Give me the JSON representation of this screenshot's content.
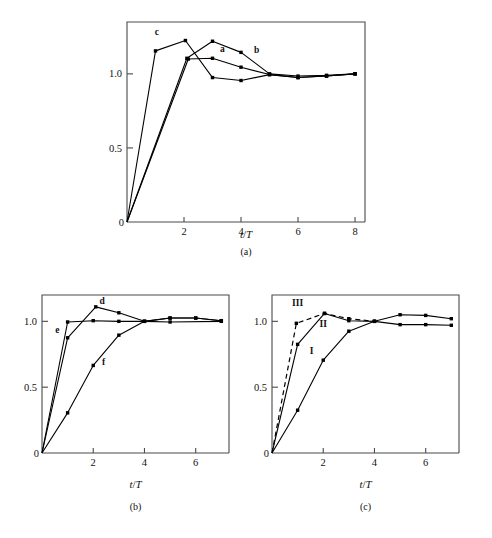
{
  "figure": {
    "background": "#ffffff",
    "ink": "#000000",
    "axis_color": "#4a4a4a"
  },
  "panels": [
    {
      "id": "a",
      "caption": "(a)",
      "xlabel_italic": "t",
      "xlabel_slash": "/",
      "xlabel_italic2": "T"
    },
    {
      "id": "b",
      "caption": "(b)",
      "xlabel_italic": "t",
      "xlabel_slash": "/",
      "xlabel_italic2": "T"
    },
    {
      "id": "c",
      "caption": "(c)",
      "xlabel_italic": "t",
      "xlabel_slash": "/",
      "xlabel_italic2": "T"
    }
  ],
  "chart_data": [
    {
      "type": "line",
      "panel": "a",
      "title": "",
      "xlabel": "t/T",
      "ylabel": "",
      "xlim": [
        0,
        8.35
      ],
      "ylim": [
        0,
        1.35
      ],
      "xticks": [
        0,
        2,
        4,
        6,
        8
      ],
      "xticklabels": [
        "0",
        "2",
        "4",
        "6",
        "8"
      ],
      "yticks": [
        0,
        0.5,
        1.0
      ],
      "yticklabels": [
        "0",
        "0.5",
        "1.0"
      ],
      "grid": false,
      "legend": "inline-curve-labels",
      "markers": "filled-square",
      "series": [
        {
          "name": "a",
          "style": "solid",
          "label_x": 3.35,
          "label_y": 1.145,
          "x": [
            0,
            2.1,
            3.0,
            4.0,
            5.0,
            6.0,
            7.0,
            8.0
          ],
          "y": [
            0,
            1.105,
            1.22,
            1.145,
            1.0,
            0.985,
            0.99,
            1.0
          ]
        },
        {
          "name": "b",
          "style": "solid",
          "label_x": 4.55,
          "label_y": 1.14,
          "x": [
            0,
            2.15,
            3.0,
            4.0,
            5.0,
            6.0,
            7.0,
            8.0
          ],
          "y": [
            0,
            1.1,
            1.105,
            1.045,
            0.995,
            0.975,
            0.985,
            1.0
          ]
        },
        {
          "name": "c",
          "style": "solid",
          "label_x": 1.05,
          "label_y": 1.265,
          "x": [
            0,
            1.0,
            2.05,
            3.0,
            4.0,
            5.0,
            6.0,
            7.0,
            8.0
          ],
          "y": [
            0,
            1.155,
            1.225,
            0.975,
            0.955,
            0.995,
            0.975,
            0.985,
            1.0
          ]
        }
      ]
    },
    {
      "type": "line",
      "panel": "b",
      "title": "",
      "xlabel": "t/T",
      "ylabel": "",
      "xlim": [
        0,
        7.3
      ],
      "ylim": [
        0,
        1.2
      ],
      "xticks": [
        0,
        2,
        4,
        6
      ],
      "xticklabels": [
        "0",
        "2",
        "4",
        "6"
      ],
      "yticks": [
        0,
        0.5,
        1.0
      ],
      "yticklabels": [
        "0",
        "0.5",
        "1.0"
      ],
      "grid": false,
      "legend": "inline-curve-labels",
      "markers": "filled-square",
      "series": [
        {
          "name": "d",
          "style": "solid",
          "label_x": 2.35,
          "label_y": 1.135,
          "x": [
            0,
            1.0,
            2.1,
            3.0,
            4.0,
            5.0,
            6.0,
            7.0
          ],
          "y": [
            0,
            0.875,
            1.11,
            1.065,
            1.0,
            1.025,
            1.025,
            1.005
          ]
        },
        {
          "name": "e",
          "style": "solid",
          "label_x": 0.6,
          "label_y": 0.915,
          "x": [
            0,
            1.0,
            2.0,
            3.0,
            4.0,
            5.0,
            7.0
          ],
          "y": [
            0,
            0.995,
            1.005,
            1.0,
            1.0,
            0.995,
            1.0
          ]
        },
        {
          "name": "f",
          "style": "solid",
          "label_x": 2.4,
          "label_y": 0.665,
          "x": [
            0,
            1.0,
            2.0,
            3.0,
            4.0,
            5.0,
            6.0,
            7.0
          ],
          "y": [
            0,
            0.305,
            0.665,
            0.895,
            1.0,
            1.025,
            1.025,
            1.005
          ]
        }
      ]
    },
    {
      "type": "line",
      "panel": "c",
      "title": "",
      "xlabel": "t/T",
      "ylabel": "",
      "xlim": [
        0,
        7.3
      ],
      "ylim": [
        0,
        1.2
      ],
      "xticks": [
        0,
        2,
        4,
        6
      ],
      "xticklabels": [
        "0",
        "2",
        "4",
        "6"
      ],
      "yticks": [
        0,
        0.5,
        1.0
      ],
      "yticklabels": [
        "0",
        "0.5",
        "1.0"
      ],
      "grid": false,
      "legend": "inline-curve-labels",
      "markers": "filled-square",
      "series": [
        {
          "name": "I",
          "style": "solid",
          "label_x": 1.55,
          "label_y": 0.755,
          "x": [
            0,
            1.0,
            2.0,
            3.0,
            4.0,
            5.0,
            6.0,
            7.0
          ],
          "y": [
            0,
            0.325,
            0.705,
            0.925,
            1.0,
            1.05,
            1.045,
            1.02
          ]
        },
        {
          "name": "II",
          "style": "solid",
          "label_x": 2.0,
          "label_y": 0.955,
          "x": [
            0,
            1.0,
            2.05,
            3.0,
            4.0,
            5.0,
            6.0,
            7.0
          ],
          "y": [
            0,
            0.825,
            1.06,
            1.005,
            1.0,
            0.975,
            0.975,
            0.97
          ]
        },
        {
          "name": "III",
          "style": "dashed",
          "label_x": 1.0,
          "label_y": 1.115,
          "x": [
            0,
            0.95,
            2.05,
            3.0,
            4.0
          ],
          "y": [
            0,
            0.985,
            1.06,
            1.02,
            1.0
          ]
        }
      ]
    }
  ]
}
